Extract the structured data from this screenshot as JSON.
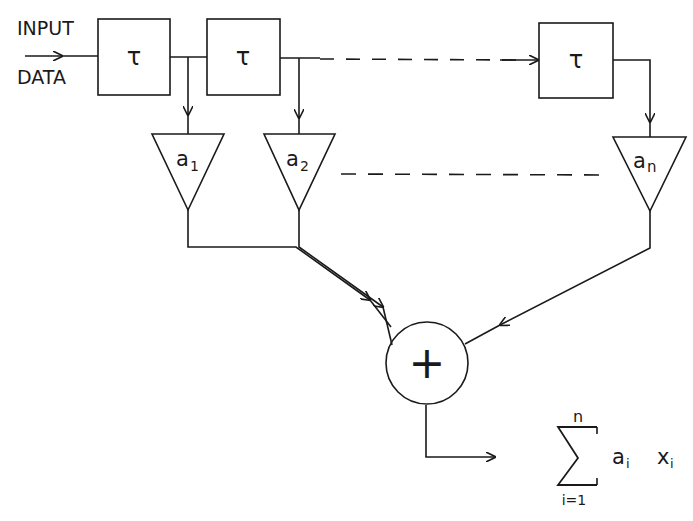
{
  "input_label": [
    "INPUT",
    "DATA"
  ],
  "delay_symbol": "τ",
  "coefficients": [
    "a",
    "a",
    "a"
  ],
  "coef_subscripts": [
    "1",
    "2",
    "n"
  ],
  "sum_symbol": "+",
  "output": {
    "sigma": "Σ",
    "upper": "n",
    "lower": "i=1",
    "term_a": "a",
    "term_a_sub": "i",
    "term_x": "x",
    "term_x_sub": "i"
  }
}
